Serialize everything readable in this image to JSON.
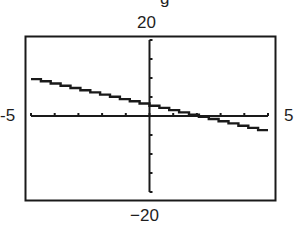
{
  "window": {
    "xmin_label": "-5",
    "xmax_label": "5",
    "ymax_label": "20",
    "ymin_label": "−20",
    "clipped_top_glyph": "g"
  },
  "chart_data": {
    "type": "line",
    "title": "",
    "xlabel": "",
    "ylabel": "",
    "xlim": [
      -5,
      5
    ],
    "ylim": [
      -20,
      20
    ],
    "xscale_tick": 1,
    "yscale_tick": 5,
    "grid": false,
    "legend": null,
    "series": [
      {
        "name": "line",
        "x": [
          -5,
          -4,
          -3,
          -2,
          -1,
          0,
          1,
          2,
          3,
          4,
          5
        ],
        "values": [
          10,
          8.6,
          7.2,
          5.8,
          4.4,
          3,
          1.6,
          0.2,
          -1.2,
          -2.6,
          -4
        ]
      }
    ],
    "annotations": [
      "Window labels: Xmin -5, Xmax 5, Ymin -20, Ymax 20"
    ]
  }
}
